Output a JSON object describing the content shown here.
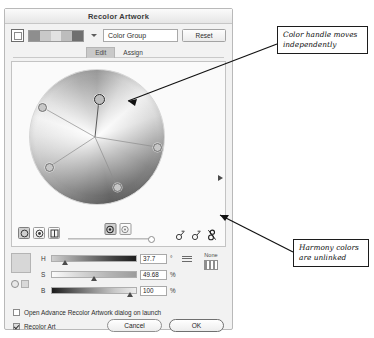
{
  "dialog": {
    "title": "Recolor Artwork",
    "topbar": {
      "target_swatch_name": "active-color-swatch",
      "strip_colors": [
        "#8e8e8e",
        "#c9c9c9",
        "#e2e2e2",
        "#bdbdbd",
        "#6f6f6f"
      ],
      "group_name": "Color Group",
      "reset_label": "Reset"
    },
    "tabs": [
      {
        "label": "Edit",
        "active": true
      },
      {
        "label": "Assign",
        "active": false
      }
    ],
    "wheel": {
      "name": "color-wheel",
      "handles": [
        {
          "name": "color-handle-primary",
          "x": 70,
          "y": 30,
          "primary": true
        },
        {
          "name": "color-handle-2",
          "x": 13,
          "y": 38,
          "primary": false
        },
        {
          "name": "color-handle-3",
          "x": 20,
          "y": 98,
          "primary": false
        },
        {
          "name": "color-handle-4",
          "x": 88,
          "y": 118,
          "primary": false
        },
        {
          "name": "color-handle-5",
          "x": 128,
          "y": 78,
          "primary": false
        }
      ],
      "center": {
        "x": 66,
        "y": 68
      }
    },
    "wheel_toolbar": {
      "view_modes": [
        {
          "name": "smooth-wheel-icon",
          "active": true
        },
        {
          "name": "segmented-wheel-icon",
          "active": false
        },
        {
          "name": "color-bars-icon",
          "active": false
        }
      ],
      "mid_icons": [
        {
          "name": "add-color-icon",
          "active": true
        },
        {
          "name": "remove-color-icon",
          "active": false
        }
      ],
      "link_icons": [
        {
          "name": "link-harmony-colors-icon"
        },
        {
          "name": "link-harmony-colors-alt-icon"
        },
        {
          "name": "unlink-harmony-colors-icon"
        }
      ]
    },
    "sliders": [
      {
        "label": "H",
        "value": "37.7",
        "unit": "°",
        "pos": 16
      },
      {
        "label": "S",
        "value": "49.68",
        "unit": "%",
        "pos": 50
      },
      {
        "label": "B",
        "value": "100",
        "unit": "%",
        "pos": 94
      }
    ],
    "none": {
      "label": "None"
    },
    "footer": {
      "checkbox_launch": {
        "label": "Open Advance Recolor Artwork dialog on launch",
        "checked": false
      },
      "checkbox_recolor": {
        "label": "Recolor Art",
        "checked": true
      },
      "cancel_label": "Cancel",
      "ok_label": "OK"
    }
  },
  "annotations": [
    {
      "name": "annotation-color-handle",
      "line1": "Color handle moves",
      "line2": "independently"
    },
    {
      "name": "annotation-harmony-unlinked",
      "line1": "Harmony colors",
      "line2": "are unlinked"
    }
  ]
}
